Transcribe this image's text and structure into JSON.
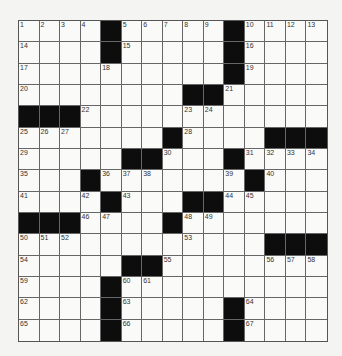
{
  "puzzle": {
    "rows": 15,
    "cols": 15,
    "colors": {
      "background": "#f4f4f2",
      "cell": "#fafaf8",
      "block": "#0d0d0d",
      "line": "#666666"
    },
    "grid": [
      [
        1,
        2,
        3,
        4,
        "#",
        5,
        6,
        7,
        8,
        9,
        "#",
        10,
        11,
        12,
        13
      ],
      [
        14,
        0,
        0,
        0,
        "#",
        15,
        0,
        0,
        0,
        0,
        "#",
        16,
        0,
        0,
        0
      ],
      [
        17,
        0,
        0,
        0,
        18,
        0,
        0,
        0,
        0,
        0,
        "#",
        19,
        0,
        0,
        0
      ],
      [
        20,
        0,
        0,
        0,
        0,
        0,
        0,
        0,
        "#",
        "#",
        21,
        0,
        0,
        0,
        0
      ],
      [
        "#",
        "#",
        "#",
        22,
        0,
        0,
        0,
        0,
        23,
        24,
        0,
        0,
        0,
        0,
        0
      ],
      [
        25,
        26,
        27,
        0,
        0,
        0,
        0,
        "#",
        28,
        0,
        0,
        0,
        "#",
        "#",
        "#"
      ],
      [
        29,
        0,
        0,
        0,
        0,
        "#",
        "#",
        30,
        0,
        0,
        "#",
        31,
        32,
        33,
        34
      ],
      [
        35,
        0,
        0,
        "#",
        36,
        37,
        38,
        0,
        0,
        0,
        39,
        "#",
        40,
        0,
        0
      ],
      [
        41,
        0,
        0,
        42,
        "#",
        43,
        0,
        0,
        "#",
        "#",
        44,
        45,
        0,
        0,
        0
      ],
      [
        "#",
        "#",
        "#",
        46,
        47,
        0,
        0,
        "#",
        48,
        49,
        0,
        0,
        0,
        0,
        0
      ],
      [
        50,
        51,
        52,
        0,
        0,
        0,
        0,
        0,
        53,
        0,
        0,
        0,
        "#",
        "#",
        "#"
      ],
      [
        54,
        0,
        0,
        0,
        0,
        "#",
        "#",
        55,
        0,
        0,
        0,
        0,
        56,
        57,
        58
      ],
      [
        59,
        0,
        0,
        0,
        "#",
        60,
        61,
        0,
        0,
        0,
        0,
        0,
        0,
        0,
        0
      ],
      [
        62,
        0,
        0,
        0,
        "#",
        63,
        0,
        0,
        0,
        0,
        "#",
        64,
        0,
        0,
        0
      ],
      [
        65,
        0,
        0,
        0,
        "#",
        66,
        0,
        0,
        0,
        0,
        "#",
        67,
        0,
        0,
        0
      ]
    ],
    "letters": []
  }
}
